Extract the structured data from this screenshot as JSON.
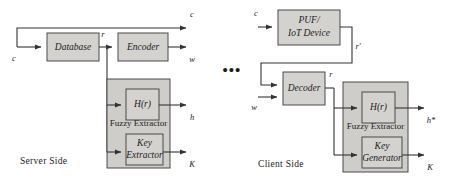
{
  "figure": {
    "server": {
      "side_label": "Server Side",
      "blocks": {
        "database": "Database",
        "encoder": "Encoder",
        "fuzzy_extractor": "Fuzzy Extractor",
        "hash": "H(r)",
        "key_line1": "Key",
        "key_line2": "Extractor"
      },
      "signals": {
        "challenge_in": "c",
        "challenge_out": "c",
        "response": "r",
        "helper_out": "w",
        "hash_out": "h",
        "key_out": "K"
      }
    },
    "client": {
      "side_label": "Client Side",
      "blocks": {
        "puf_line1": "PUF/",
        "puf_line2": "IoT Device",
        "decoder": "Decoder",
        "fuzzy_extractor": "Fuzzy Extractor",
        "hash": "H(r)",
        "key_line1": "Key",
        "key_line2": "Generator"
      },
      "signals": {
        "challenge_in": "c",
        "response_prime": "r'",
        "helper_in": "w",
        "recovered_response": "r",
        "hash_out": "h*",
        "key_out": "K"
      }
    },
    "separator": "•••"
  },
  "colors": {
    "box_fill": "#d4d2cf",
    "group_fill": "#cfcdca",
    "stroke": "#4a4a4a",
    "wire": "#333333",
    "text": "#1c1c1c",
    "background": "#ffffff"
  }
}
